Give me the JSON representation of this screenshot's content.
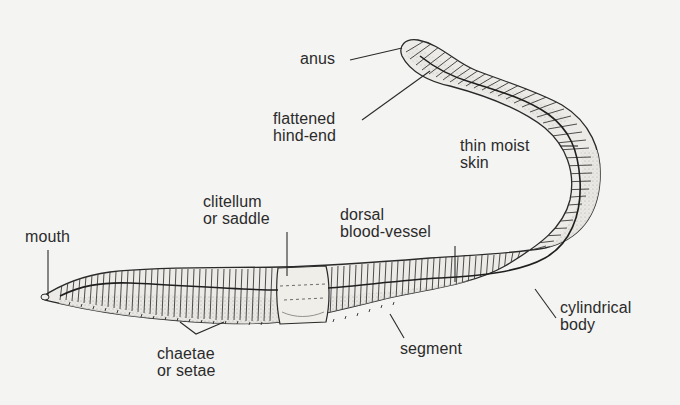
{
  "diagram": {
    "labels": {
      "anus": {
        "lines": [
          "anus"
        ]
      },
      "flattened_hind_end": {
        "lines": [
          "flattened",
          "hind-end"
        ]
      },
      "thin_moist_skin": {
        "lines": [
          "thin moist",
          "skin"
        ]
      },
      "clitellum": {
        "lines": [
          "clitellum",
          "or saddle"
        ]
      },
      "dorsal_blood_vessel": {
        "lines": [
          "dorsal",
          "blood-vessel"
        ]
      },
      "mouth": {
        "lines": [
          "mouth"
        ]
      },
      "cylindrical_body": {
        "lines": [
          "cylindrical",
          "body"
        ]
      },
      "segment": {
        "lines": [
          "segment"
        ]
      },
      "chaetae": {
        "lines": [
          "chaetae",
          "or setae"
        ]
      }
    },
    "colors": {
      "background": "#f4f4f2",
      "ink": "#2a2a2a",
      "body_fill": "#ecebe7",
      "shade": "#b9b8b3"
    }
  }
}
